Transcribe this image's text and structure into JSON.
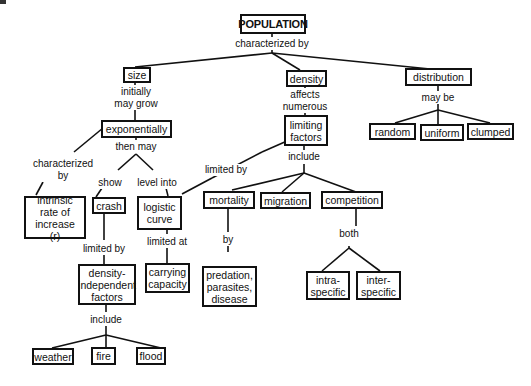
{
  "diagram": {
    "type": "concept-map",
    "nodes": {
      "population": "POPULATION",
      "size": "size",
      "density": "density",
      "distribution": "distribution",
      "exponentially": "exponentially",
      "limiting_factors": "limiting\nfactors",
      "random": "random",
      "uniform": "uniform",
      "clumped": "clumped",
      "intrinsic": "intrinsic\nrate of\nincrease  (r)",
      "crash": "crash",
      "logistic": "logistic\ncurve",
      "mortality": "mortality",
      "migration": "migration",
      "competition": "competition",
      "density_independent": "density-\nindependent\nfactors",
      "carrying_capacity": "carrying\ncapacity",
      "predation": "predation,\nparasites,\ndisease",
      "intra": "intra-\nspecific",
      "inter": "inter-\nspecific",
      "weather": "weather",
      "fire": "fire",
      "flood": "flood"
    },
    "links": {
      "characterized_by": "characterized  by",
      "initially_may_grow": "initially\nmay  grow",
      "affects_numerous": "affects\nnumerous",
      "may_be": "may  be",
      "characterized_by_2": "characterized\nby",
      "then_may": "then  may",
      "limited_by_arrow": "limited  by",
      "include_1": "include",
      "show": "show",
      "level_into": "level  into",
      "limited_by_2": "limited  by",
      "limited_at": "limited  at",
      "by": "by",
      "both": "both",
      "include_2": "include"
    }
  }
}
